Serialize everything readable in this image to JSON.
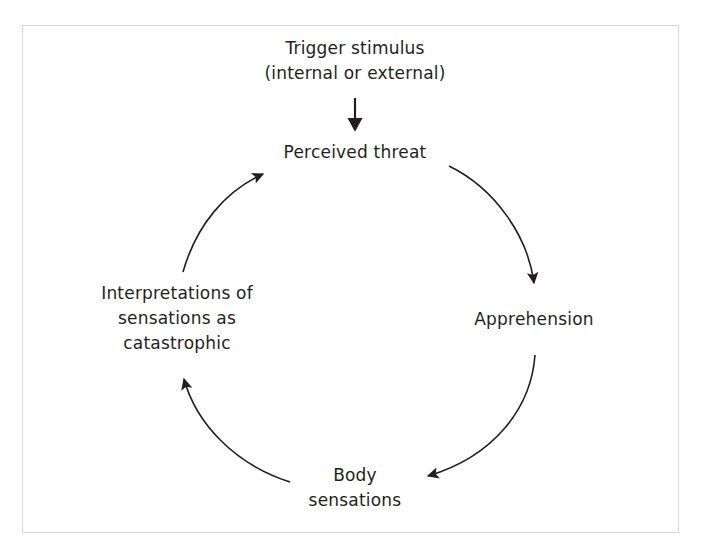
{
  "diagram": {
    "type": "cycle-flow",
    "text_color": "#231f20",
    "border_color": "#d8d8d8",
    "background": "#ffffff",
    "nodes": [
      {
        "id": "trigger",
        "label": "Trigger stimulus\n(internal or external)",
        "x": 355,
        "y": 62
      },
      {
        "id": "perceived_threat",
        "label": "Perceived threat",
        "x": 355,
        "y": 152
      },
      {
        "id": "apprehension",
        "label": "Apprehension",
        "x": 534,
        "y": 319
      },
      {
        "id": "body_sensations",
        "label": "Body\nsensations",
        "x": 355,
        "y": 487
      },
      {
        "id": "interpretations",
        "label": "Interpretations of\nsensations as\ncatastrophic",
        "x": 177,
        "y": 320
      }
    ],
    "arrows": [
      {
        "id": "trigger-to-threat",
        "from": "trigger",
        "to": "perceived_threat",
        "shape": "straight-down"
      },
      {
        "id": "threat-to-apprehension",
        "from": "perceived_threat",
        "to": "apprehension",
        "shape": "arc-clockwise"
      },
      {
        "id": "apprehension-to-body",
        "from": "apprehension",
        "to": "body_sensations",
        "shape": "arc-clockwise"
      },
      {
        "id": "body-to-interpretations",
        "from": "body_sensations",
        "to": "interpretations",
        "shape": "arc-clockwise"
      },
      {
        "id": "interpretations-to-threat",
        "from": "interpretations",
        "to": "perceived_threat",
        "shape": "arc-clockwise"
      }
    ]
  }
}
